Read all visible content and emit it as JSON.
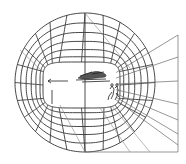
{
  "diagram": {
    "title": "",
    "type": "curvilinear-perspective-grid",
    "colors": {
      "line": "#333333",
      "fan": "#6a6a6a",
      "background": "#ffffff"
    },
    "center": [
      85,
      82
    ],
    "outer_ellipse": {
      "cx": 85,
      "cy": 82.5,
      "rx": 70,
      "ry": 69.5
    },
    "inner_opening": {
      "x": 43,
      "y": 62,
      "w": 77,
      "h": 46,
      "r": 16
    },
    "ring_count": 6,
    "radial_count": 24,
    "fan_plane": {
      "x": 178,
      "y_top": 35,
      "y_bottom": 152
    },
    "elements": [
      {
        "name": "left-arrow",
        "label": ""
      },
      {
        "name": "cloud-sketch",
        "label": ""
      },
      {
        "name": "figures-sketch",
        "label": ""
      }
    ]
  }
}
